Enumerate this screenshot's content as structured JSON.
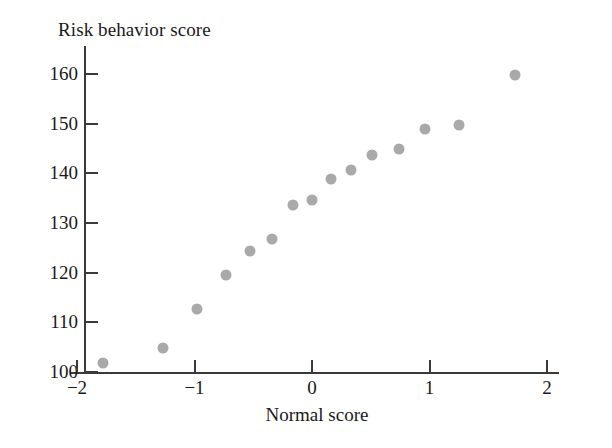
{
  "chart_data": {
    "type": "scatter",
    "title": "",
    "ylabel": "Risk behavior score",
    "xlabel": "Normal score",
    "xlim": [
      -2.1,
      2.2
    ],
    "ylim": [
      98.6,
      164.0
    ],
    "grid": false,
    "legend": null,
    "marker_color": "#a9a9a9",
    "axis_color": "#3a3a3a",
    "xticks": [
      -2,
      -1,
      0,
      1,
      2
    ],
    "xtick_labels": [
      "−2",
      "−1",
      "0",
      "1",
      "2"
    ],
    "yticks": [
      100,
      110,
      120,
      130,
      140,
      150,
      160
    ],
    "ytick_labels": [
      "100",
      "110",
      "120",
      "130",
      "140",
      "150",
      "160"
    ],
    "points": [
      {
        "x": -1.78,
        "y": 101.8
      },
      {
        "x": -1.27,
        "y": 104.8
      },
      {
        "x": -0.98,
        "y": 112.6
      },
      {
        "x": -0.73,
        "y": 119.6
      },
      {
        "x": -0.53,
        "y": 124.4
      },
      {
        "x": -0.34,
        "y": 126.8
      },
      {
        "x": -0.16,
        "y": 133.6
      },
      {
        "x": 0.0,
        "y": 134.6
      },
      {
        "x": 0.16,
        "y": 138.8
      },
      {
        "x": 0.33,
        "y": 140.6
      },
      {
        "x": 0.51,
        "y": 143.6
      },
      {
        "x": 0.74,
        "y": 144.8
      },
      {
        "x": 0.96,
        "y": 148.8
      },
      {
        "x": 1.25,
        "y": 149.6
      },
      {
        "x": 1.73,
        "y": 159.8
      }
    ]
  }
}
